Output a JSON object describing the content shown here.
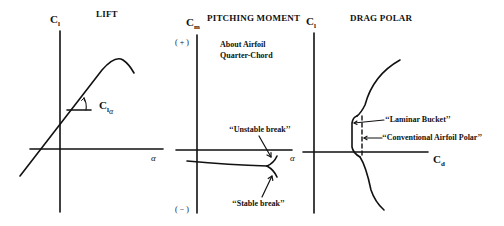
{
  "panels": {
    "lift": {
      "title": "LIFT",
      "y_axis": {
        "symbol": "C",
        "sub": "l"
      },
      "x_axis": {
        "symbol": "α"
      },
      "slope_label": {
        "symbol": "C",
        "sub": "l",
        "subsub": "α"
      }
    },
    "pitching": {
      "title": "PITCHING MOMENT",
      "y_axis": {
        "symbol": "C",
        "sub": "m"
      },
      "x_axis": {
        "symbol": "α"
      },
      "positive": "( + )",
      "negative": "( − )",
      "note_line1": "About Airfoil",
      "note_line2": "Quarter-Chord",
      "unstable": "‘‘Unstable break’’",
      "stable": "‘‘Stable break’’"
    },
    "drag": {
      "title": "DRAG POLAR",
      "y_axis": {
        "symbol": "C",
        "sub": "l"
      },
      "x_axis": {
        "symbol": "C",
        "sub": "d"
      },
      "laminar": "‘‘Laminar Bucket’’",
      "conventional": "‘‘Conventional Airfoil Polar’’"
    }
  },
  "colors": {
    "ink": "#111111",
    "background": "#ffffff"
  }
}
